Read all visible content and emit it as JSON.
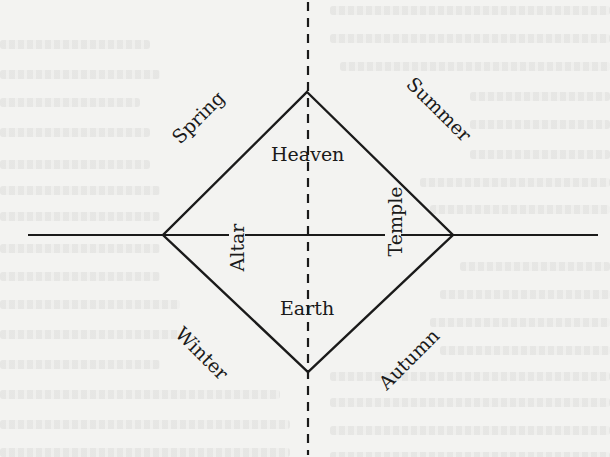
{
  "diagram": {
    "labels": {
      "heaven": "Heaven",
      "earth": "Earth",
      "altar": "Altar",
      "temple": "Temple",
      "spring": "Spring",
      "summer": "Summer",
      "autumn": "Autumn",
      "winter": "Winter"
    },
    "geometry": {
      "diamond": {
        "top": [
          307,
          92
        ],
        "right": [
          453,
          235
        ],
        "bottom": [
          308,
          372
        ],
        "left": [
          163,
          235
        ]
      },
      "horizontal_axis": {
        "x1": 28,
        "x2": 598,
        "y": 235
      },
      "vertical_axis": {
        "x": 308,
        "y1": 0,
        "y2": 457,
        "style": "dashed"
      }
    },
    "colors": {
      "ink": "#1a1a1a",
      "paper": "#f3f3f1"
    }
  }
}
